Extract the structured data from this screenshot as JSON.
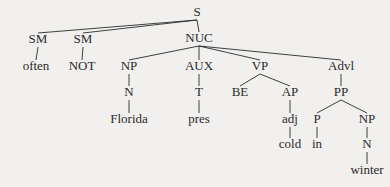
{
  "diagram": {
    "type": "syntax-tree",
    "colors": {
      "background": "#f1f0ee",
      "ink": "#2a2a2a"
    },
    "nodes": [
      {
        "id": "S",
        "label": "S",
        "x": 197,
        "y": 18
      },
      {
        "id": "NUC",
        "label": "NUC",
        "x": 199,
        "y": 44
      },
      {
        "id": "SM1",
        "label": "SM",
        "x": 38,
        "y": 45
      },
      {
        "id": "SM2",
        "label": "SM",
        "x": 83,
        "y": 45
      },
      {
        "id": "often",
        "label": "often",
        "x": 36,
        "y": 72
      },
      {
        "id": "NOT",
        "label": "NOT",
        "x": 82,
        "y": 72
      },
      {
        "id": "NP1",
        "label": "NP",
        "x": 129,
        "y": 72
      },
      {
        "id": "AUX",
        "label": "AUX",
        "x": 199,
        "y": 72
      },
      {
        "id": "VP",
        "label": "VP",
        "x": 260,
        "y": 72
      },
      {
        "id": "Advl",
        "label": "Advl",
        "x": 341,
        "y": 72
      },
      {
        "id": "N1",
        "label": "N",
        "x": 129,
        "y": 98
      },
      {
        "id": "T",
        "label": "T",
        "x": 199,
        "y": 98
      },
      {
        "id": "BE",
        "label": "BE",
        "x": 240,
        "y": 98
      },
      {
        "id": "AP",
        "label": "AP",
        "x": 290,
        "y": 98
      },
      {
        "id": "PP",
        "label": "PP",
        "x": 341,
        "y": 98
      },
      {
        "id": "Florida",
        "label": "Florida",
        "x": 129,
        "y": 125
      },
      {
        "id": "pres",
        "label": "pres",
        "x": 199,
        "y": 125
      },
      {
        "id": "adj",
        "label": "adj",
        "x": 290,
        "y": 125
      },
      {
        "id": "P",
        "label": "P",
        "x": 317,
        "y": 125
      },
      {
        "id": "NP2",
        "label": "NP",
        "x": 367,
        "y": 125
      },
      {
        "id": "cold",
        "label": "cold",
        "x": 290,
        "y": 150
      },
      {
        "id": "in",
        "label": "in",
        "x": 317,
        "y": 150
      },
      {
        "id": "N2",
        "label": "N",
        "x": 367,
        "y": 150
      },
      {
        "id": "winter",
        "label": "winter",
        "x": 367,
        "y": 176
      }
    ],
    "edges": [
      [
        "S",
        "SM1"
      ],
      [
        "S",
        "SM2"
      ],
      [
        "S",
        "NUC"
      ],
      [
        "SM1",
        "often"
      ],
      [
        "SM2",
        "NOT"
      ],
      [
        "NUC",
        "NP1"
      ],
      [
        "NUC",
        "AUX"
      ],
      [
        "NUC",
        "VP"
      ],
      [
        "NUC",
        "Advl"
      ],
      [
        "NP1",
        "N1"
      ],
      [
        "N1",
        "Florida"
      ],
      [
        "AUX",
        "T"
      ],
      [
        "T",
        "pres"
      ],
      [
        "VP",
        "BE"
      ],
      [
        "VP",
        "AP"
      ],
      [
        "AP",
        "adj"
      ],
      [
        "adj",
        "cold"
      ],
      [
        "Advl",
        "PP"
      ],
      [
        "PP",
        "P"
      ],
      [
        "PP",
        "NP2"
      ],
      [
        "P",
        "in"
      ],
      [
        "NP2",
        "N2"
      ],
      [
        "N2",
        "winter"
      ]
    ]
  }
}
